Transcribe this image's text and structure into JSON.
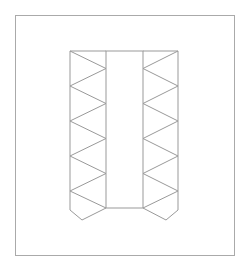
{
  "diagram": {
    "type": "net-template",
    "stroke_color": "#999999",
    "frame_color": "#aaaaaa",
    "background": "#ffffff",
    "frame": {
      "x": 15,
      "y": 15,
      "width": 219,
      "height": 240
    },
    "center_rect": {
      "x": 106,
      "y": 51,
      "width": 37,
      "height": 157
    },
    "left_column": {
      "outer_x": 70,
      "inner_x": 106,
      "outer_vertices_y": [
        51,
        86,
        121,
        156,
        191
      ],
      "inner_vertices_y": [
        68.5,
        103.5,
        138.5,
        173.5,
        208
      ],
      "tab": [
        [
          70,
          191
        ],
        [
          70,
          210
        ],
        [
          82,
          220
        ],
        [
          106,
          208
        ]
      ]
    },
    "right_column": {
      "outer_x": 178,
      "inner_x": 143,
      "outer_vertices_y": [
        51,
        86,
        121,
        156,
        191
      ],
      "inner_vertices_y": [
        68.5,
        103.5,
        138.5,
        173.5,
        208
      ],
      "tab": [
        [
          178,
          191
        ],
        [
          178,
          210
        ],
        [
          166,
          220
        ],
        [
          143,
          208
        ]
      ]
    }
  }
}
